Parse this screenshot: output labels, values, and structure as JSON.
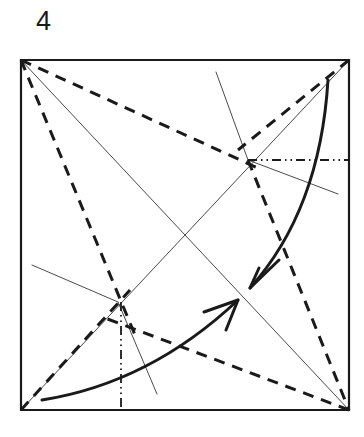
{
  "figure": {
    "step_number": "4",
    "ink_color": "#1a1a1a",
    "paper_color": "#ffffff",
    "crease_color": "#4a4a4a"
  },
  "paper": {
    "shape": "square",
    "corners": {
      "top_left": [
        21,
        60
      ],
      "top_right": [
        349,
        60
      ],
      "bottom_right": [
        349,
        410
      ],
      "bottom_left": [
        21,
        410
      ]
    },
    "border_width": 2.2
  },
  "reference_points": {
    "upper_node": [
      248,
      160
    ],
    "lower_node": [
      118,
      302
    ],
    "center": [
      185,
      235
    ]
  },
  "creases": {
    "label": "existing crease lines",
    "style": "thin solid",
    "width": 1.0,
    "lines": [
      {
        "name": "diagonal-tl-br",
        "from": [
          21,
          60
        ],
        "to": [
          349,
          410
        ]
      },
      {
        "name": "diagonal-bl-tr",
        "from": [
          21,
          410
        ],
        "to": [
          349,
          60
        ]
      },
      {
        "name": "spur-upper-node-top-edge",
        "from": [
          216,
          72
        ],
        "to": [
          248,
          160
        ]
      },
      {
        "name": "spur-upper-node-right",
        "from": [
          248,
          160
        ],
        "to": [
          338,
          194
        ]
      },
      {
        "name": "spur-lower-node-left",
        "from": [
          32,
          265
        ],
        "to": [
          118,
          302
        ]
      },
      {
        "name": "spur-lower-node-bottom",
        "from": [
          118,
          302
        ],
        "to": [
          157,
          394
        ]
      }
    ]
  },
  "valley_folds": {
    "label": "valley fold lines",
    "style": "bold dashed",
    "width": 3.0,
    "dash": "11 8",
    "lines": [
      {
        "name": "valley-tl-to-upper-node",
        "from": [
          21,
          60
        ],
        "to": [
          262,
          170
        ]
      },
      {
        "name": "valley-tl-to-lower-node",
        "from": [
          21,
          60
        ],
        "to": [
          135,
          335
        ]
      },
      {
        "name": "valley-tr-to-upper-node",
        "from": [
          349,
          60
        ],
        "to": [
          238,
          150
        ]
      },
      {
        "name": "valley-upper-node-to-br",
        "from": [
          248,
          160
        ],
        "to": [
          349,
          410
        ]
      },
      {
        "name": "valley-br-to-lower-node",
        "from": [
          349,
          410
        ],
        "to": [
          105,
          318
        ]
      },
      {
        "name": "valley-bl-to-lower-node",
        "from": [
          21,
          410
        ],
        "to": [
          130,
          290
        ]
      }
    ]
  },
  "mountain_folds": {
    "label": "mountain fold lines",
    "style": "dash-dot-dot",
    "width": 1.8,
    "dash": "9 4 1.5 4 1.5 4",
    "lines": [
      {
        "name": "mountain-upper-node-horizontal",
        "from": [
          248,
          160
        ],
        "to": [
          349,
          160
        ]
      },
      {
        "name": "mountain-lower-node-vertical",
        "from": [
          121,
          302
        ],
        "to": [
          121,
          410
        ]
      }
    ]
  },
  "arrows": [
    {
      "name": "fold-arrow-down-right",
      "direction": "down-left",
      "style": "bold curved with open V head",
      "width": 3.0,
      "path_start": [
        328,
        80
      ],
      "path_control": [
        320,
        210
      ],
      "path_end": [
        250,
        288
      ],
      "head_wing_a": [
        279,
        260
      ],
      "head_wing_b": [
        259,
        268
      ]
    },
    {
      "name": "fold-arrow-up-right",
      "direction": "up-right",
      "style": "bold curved with open V head",
      "width": 3.0,
      "path_start": [
        42,
        400
      ],
      "path_control": [
        150,
        383
      ],
      "path_end": [
        238,
        300
      ],
      "head_wing_a": [
        204,
        312
      ],
      "head_wing_b": [
        226,
        330
      ]
    }
  ]
}
